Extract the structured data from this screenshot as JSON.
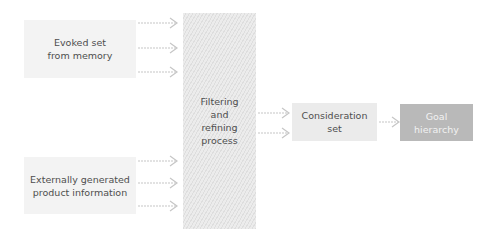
{
  "diagram": {
    "nodes": [
      {
        "id": "evoked",
        "label": "Evoked set\nfrom memory"
      },
      {
        "id": "external",
        "label": "Externally generated\nproduct information"
      },
      {
        "id": "filter",
        "label": "Filtering\nand\nrefining\nprocess"
      },
      {
        "id": "consideration",
        "label": "Consideration\nset"
      },
      {
        "id": "goal",
        "label": "Goal\nhierarchy"
      }
    ],
    "edges": [
      {
        "from": "evoked",
        "to": "filter",
        "count": 3
      },
      {
        "from": "external",
        "to": "filter",
        "count": 3
      },
      {
        "from": "filter",
        "to": "consideration",
        "count": 2
      },
      {
        "from": "consideration",
        "to": "goal",
        "count": 1
      }
    ],
    "colors": {
      "source_fill": "#f3f3f3",
      "filter_stripe_dark": "#dedede",
      "filter_stripe_light": "#ececec",
      "consideration_fill": "#ebebeb",
      "goal_fill": "#b9b9b9",
      "arrow": "#c6c6c6",
      "text": "#4e4e4e"
    }
  }
}
